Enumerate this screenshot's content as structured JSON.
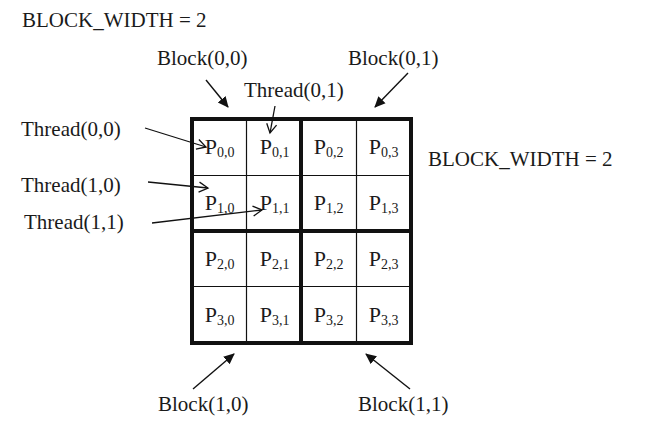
{
  "title": "BLOCK_WIDTH = 2",
  "side_label": "BLOCK_WIDTH = 2",
  "block_labels": {
    "b00": "Block(0,0)",
    "b01": "Block(0,1)",
    "b10": "Block(1,0)",
    "b11": "Block(1,1)"
  },
  "thread_labels": {
    "t00": "Thread(0,0)",
    "t01": "Thread(0,1)",
    "t10": "Thread(1,0)",
    "t11": "Thread(1,1)"
  },
  "grid": {
    "rows": 4,
    "cols": 4,
    "block_width": 2,
    "cells": [
      [
        {
          "p": "P",
          "sub": "0,0"
        },
        {
          "p": "P",
          "sub": "0,1"
        },
        {
          "p": "P",
          "sub": "0,2"
        },
        {
          "p": "P",
          "sub": "0,3"
        }
      ],
      [
        {
          "p": "P",
          "sub": "1,0"
        },
        {
          "p": "P",
          "sub": "1,1"
        },
        {
          "p": "P",
          "sub": "1,2"
        },
        {
          "p": "P",
          "sub": "1,3"
        }
      ],
      [
        {
          "p": "P",
          "sub": "2,0"
        },
        {
          "p": "P",
          "sub": "2,1"
        },
        {
          "p": "P",
          "sub": "2,2"
        },
        {
          "p": "P",
          "sub": "2,3"
        }
      ],
      [
        {
          "p": "P",
          "sub": "3,0"
        },
        {
          "p": "P",
          "sub": "3,1"
        },
        {
          "p": "P",
          "sub": "3,2"
        },
        {
          "p": "P",
          "sub": "3,3"
        }
      ]
    ]
  },
  "colors": {
    "line": "#111111",
    "text": "#1a1a1a",
    "background": "#ffffff"
  }
}
